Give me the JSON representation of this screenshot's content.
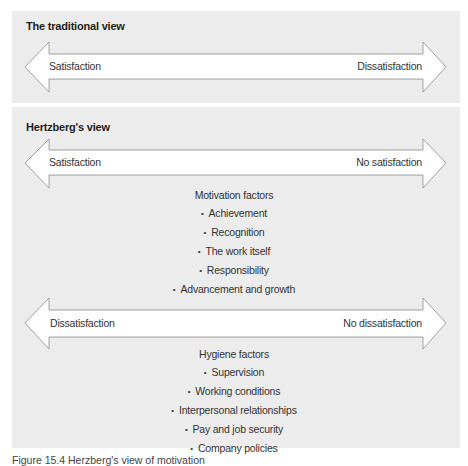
{
  "colors": {
    "panel_bg": "#ececec",
    "arrow_fill": "#ffffff",
    "arrow_stroke": "#8a8a8a",
    "text": "#333333"
  },
  "traditional_view": {
    "title": "The traditional view",
    "arrow": {
      "left_label": "Satisfaction",
      "right_label": "Dissatisfaction"
    }
  },
  "herzberg_view": {
    "title": "Hertzberg's view",
    "motivation_arrow": {
      "left_label": "Satisfaction",
      "right_label": "No satisfaction"
    },
    "motivation_factors": {
      "heading": "Motivation factors",
      "items": [
        "Achievement",
        "Recognition",
        "The work itself",
        "Responsibility",
        "Advancement and growth"
      ]
    },
    "hygiene_arrow": {
      "left_label": "Dissatisfaction",
      "right_label": "No dissatisfaction"
    },
    "hygiene_factors": {
      "heading": "Hygiene factors",
      "items": [
        "Supervision",
        "Working conditions",
        "Interpersonal relationships",
        "Pay and job security",
        "Company policies"
      ]
    }
  },
  "caption": "Figure 15.4  Herzberg's view of motivation"
}
